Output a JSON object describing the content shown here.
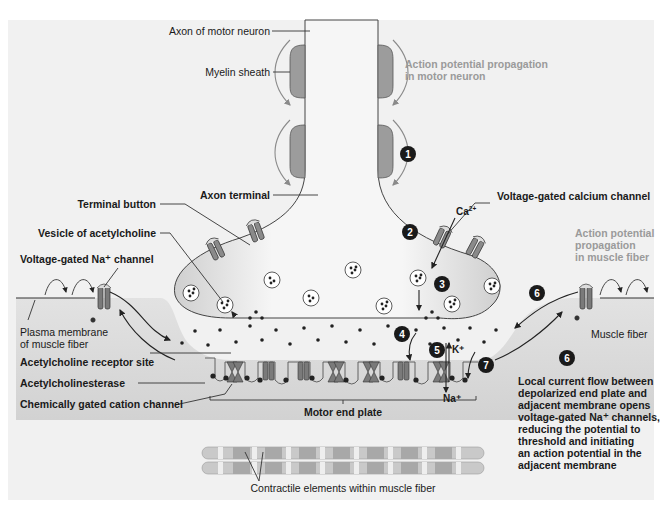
{
  "labels": {
    "axon_of_motor_neuron": "Axon of motor neuron",
    "myelin_sheath": "Myelin sheath",
    "ap_motor_line1": "Action potential propagation",
    "ap_motor_line2": "in motor neuron",
    "axon_terminal": "Axon terminal",
    "terminal_button": "Terminal button",
    "vesicle_of_acetylcholine": "Vesicle of acetylcholine",
    "voltage_gated_na_channel": "Voltage-gated Na⁺ channel",
    "voltage_gated_calcium_channel": "Voltage-gated calcium channel",
    "ap_muscle_line1": "Action potential",
    "ap_muscle_line2": "propagation",
    "ap_muscle_line3": "in muscle fiber",
    "plasma_membrane_line1": "Plasma membrane",
    "plasma_membrane_line2": "of muscle fiber",
    "muscle_fiber": "Muscle fiber",
    "ach_receptor_site": "Acetylcholine receptor site",
    "acetylcholinesterase": "Acetylcholinesterase",
    "chemically_gated_cation_channel": "Chemically gated cation channel",
    "motor_end_plate": "Motor end plate",
    "contractile_elements": "Contractile elements within muscle fiber"
  },
  "ions": {
    "calcium": "Ca",
    "calcium_charge": "2+",
    "potassium": "K⁺",
    "sodium": "Na⁺"
  },
  "steps": [
    "1",
    "2",
    "3",
    "4",
    "5",
    "6",
    "6",
    "7"
  ],
  "step6_caption": [
    "Local current flow between",
    "depolarized end plate and",
    "adjacent membrane opens",
    "voltage-gated Na⁺ channels,",
    "reducing the potential to",
    "threshold and initiating",
    "an action potential in the",
    "adjacent membrane"
  ],
  "colors": {
    "background": "#f1f1f1",
    "terminal_fill": "#f6f6f6",
    "myelin": "#9c9c9c",
    "channel": "#7a7a7a",
    "muscle": "#dcdcdc",
    "step_badge": "#1a1a1a",
    "grey_text": "#9a9a9a"
  }
}
